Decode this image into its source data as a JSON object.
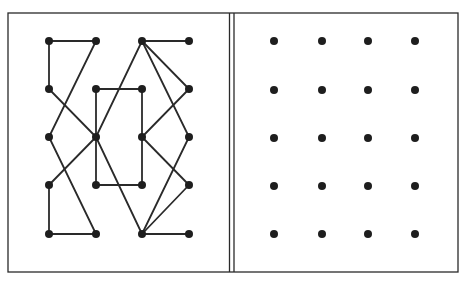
{
  "frame": {
    "outer": {
      "x1": 8,
      "y1": 13,
      "x2": 458,
      "y2": 272
    },
    "divider_x": [
      229.5,
      234
    ],
    "stroke": "#2a2a2a",
    "background": "#ffffff"
  },
  "puzzle": {
    "description": "Left panel: dot grid with connecting line pattern; right panel: blank 4x5 dot grid to copy the pattern onto",
    "dot_color": "#1e1e1e",
    "line_color": "#2a2a2a",
    "left_panel": {
      "columns_x": [
        49,
        96,
        142,
        189
      ],
      "rows_y": [
        41,
        89,
        137,
        185,
        234
      ],
      "dots": [
        [
          0,
          0
        ],
        [
          1,
          0
        ],
        [
          2,
          0
        ],
        [
          3,
          0
        ],
        [
          0,
          1
        ],
        [
          1,
          1
        ],
        [
          2,
          1
        ],
        [
          3,
          1
        ],
        [
          0,
          2
        ],
        [
          1,
          2
        ],
        [
          2,
          2
        ],
        [
          3,
          2
        ],
        [
          0,
          3
        ],
        [
          1,
          3
        ],
        [
          2,
          3
        ],
        [
          3,
          3
        ],
        [
          0,
          4
        ],
        [
          1,
          4
        ],
        [
          2,
          4
        ],
        [
          3,
          4
        ]
      ],
      "edges": [
        [
          [
            0,
            0
          ],
          [
            1,
            0
          ]
        ],
        [
          [
            0,
            0
          ],
          [
            0,
            1
          ]
        ],
        [
          [
            1,
            0
          ],
          [
            0,
            2
          ]
        ],
        [
          [
            0,
            1
          ],
          [
            1,
            2
          ]
        ],
        [
          [
            0,
            2
          ],
          [
            1,
            4
          ]
        ],
        [
          [
            1,
            2
          ],
          [
            0,
            3
          ]
        ],
        [
          [
            0,
            3
          ],
          [
            0,
            4
          ]
        ],
        [
          [
            0,
            4
          ],
          [
            1,
            4
          ]
        ],
        [
          [
            1,
            1
          ],
          [
            2,
            1
          ]
        ],
        [
          [
            2,
            1
          ],
          [
            2,
            3
          ]
        ],
        [
          [
            2,
            3
          ],
          [
            1,
            3
          ]
        ],
        [
          [
            1,
            3
          ],
          [
            1,
            1
          ]
        ],
        [
          [
            1,
            2
          ],
          [
            2,
            0
          ]
        ],
        [
          [
            1,
            2
          ],
          [
            2,
            4
          ]
        ],
        [
          [
            2,
            0
          ],
          [
            3,
            0
          ]
        ],
        [
          [
            2,
            0
          ],
          [
            3,
            1
          ]
        ],
        [
          [
            2,
            0
          ],
          [
            3,
            2
          ]
        ],
        [
          [
            3,
            1
          ],
          [
            2,
            2
          ]
        ],
        [
          [
            2,
            2
          ],
          [
            3,
            3
          ]
        ],
        [
          [
            3,
            2
          ],
          [
            2,
            4
          ]
        ],
        [
          [
            3,
            3
          ],
          [
            2,
            4
          ]
        ],
        [
          [
            2,
            4
          ],
          [
            3,
            4
          ]
        ]
      ]
    },
    "right_panel": {
      "columns_x": [
        274,
        322,
        368,
        415
      ],
      "rows_y": [
        41,
        90,
        138,
        186,
        234
      ],
      "dot_count": 20
    }
  }
}
